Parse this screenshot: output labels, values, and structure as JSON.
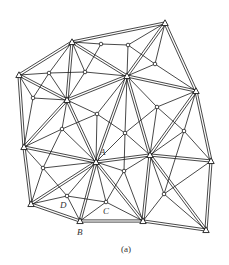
{
  "caption": "(a)",
  "labels": [
    {
      "text": "A",
      "x": 100,
      "y": 155
    },
    {
      "text": "B",
      "x": 77,
      "y": 235
    },
    {
      "text": "C",
      "x": 103,
      "y": 214
    },
    {
      "text": "D",
      "x": 60,
      "y": 208
    }
  ],
  "colors": {
    "line": "#1a1a1a",
    "background": "#ffffff"
  },
  "triangle_nodes": [
    {
      "id": "T1",
      "x": 72,
      "y": 42
    },
    {
      "id": "T2",
      "x": 165,
      "y": 23
    },
    {
      "id": "T3",
      "x": 19,
      "y": 75
    },
    {
      "id": "T4",
      "x": 127,
      "y": 76
    },
    {
      "id": "T5",
      "x": 196,
      "y": 91
    },
    {
      "id": "T6",
      "x": 67,
      "y": 100
    },
    {
      "id": "T7",
      "x": 24,
      "y": 147
    },
    {
      "id": "T8",
      "x": 96,
      "y": 162
    },
    {
      "id": "T9",
      "x": 150,
      "y": 155
    },
    {
      "id": "T10",
      "x": 211,
      "y": 161
    },
    {
      "id": "T11",
      "x": 31,
      "y": 204
    },
    {
      "id": "T12",
      "x": 80,
      "y": 221
    },
    {
      "id": "T13",
      "x": 143,
      "y": 221
    },
    {
      "id": "T14",
      "x": 206,
      "y": 230
    }
  ],
  "circle_nodes": [
    {
      "id": "c1",
      "x": 101,
      "y": 44
    },
    {
      "id": "c2",
      "x": 128,
      "y": 45
    },
    {
      "id": "c3",
      "x": 49,
      "y": 73
    },
    {
      "id": "c4",
      "x": 85,
      "y": 72
    },
    {
      "id": "c5",
      "x": 155,
      "y": 64
    },
    {
      "id": "c6",
      "x": 33,
      "y": 98
    },
    {
      "id": "c7",
      "x": 97,
      "y": 114
    },
    {
      "id": "c8",
      "x": 157,
      "y": 107
    },
    {
      "id": "c9",
      "x": 62,
      "y": 129
    },
    {
      "id": "c10",
      "x": 125,
      "y": 133
    },
    {
      "id": "c11",
      "x": 184,
      "y": 131
    },
    {
      "id": "c12",
      "x": 43,
      "y": 168
    },
    {
      "id": "c13",
      "x": 124,
      "y": 171
    },
    {
      "id": "c14",
      "x": 164,
      "y": 194
    },
    {
      "id": "c15",
      "x": 67,
      "y": 196
    },
    {
      "id": "c16",
      "x": 106,
      "y": 202
    }
  ],
  "double_edges": [
    [
      "T1",
      "T2"
    ],
    [
      "T1",
      "T3"
    ],
    [
      "T2",
      "T5"
    ],
    [
      "T3",
      "T7"
    ],
    [
      "T7",
      "T11"
    ],
    [
      "T11",
      "T12"
    ],
    [
      "T12",
      "T13"
    ],
    [
      "T13",
      "T14"
    ],
    [
      "T14",
      "T10"
    ],
    [
      "T10",
      "T5"
    ],
    [
      "T1",
      "T6"
    ],
    [
      "T1",
      "T4"
    ],
    [
      "T3",
      "T6"
    ],
    [
      "T6",
      "T4"
    ],
    [
      "T4",
      "T2"
    ],
    [
      "T4",
      "T5"
    ],
    [
      "T4",
      "T8"
    ],
    [
      "T6",
      "T8"
    ],
    [
      "T7",
      "T8"
    ],
    [
      "T8",
      "T9"
    ],
    [
      "T9",
      "T10"
    ],
    [
      "T8",
      "T12"
    ],
    [
      "T8",
      "T13"
    ],
    [
      "T9",
      "T13"
    ],
    [
      "T9",
      "T4"
    ],
    [
      "T9",
      "T5"
    ],
    [
      "T9",
      "T14"
    ],
    [
      "T11",
      "T8"
    ],
    [
      "T6",
      "T7"
    ]
  ],
  "single_edges": [
    [
      "T1",
      "c1"
    ],
    [
      "c1",
      "c2"
    ],
    [
      "c2",
      "T2"
    ],
    [
      "c1",
      "c4"
    ],
    [
      "c2",
      "T4"
    ],
    [
      "c2",
      "c5"
    ],
    [
      "T3",
      "c3"
    ],
    [
      "c3",
      "c4"
    ],
    [
      "c4",
      "T4"
    ],
    [
      "c3",
      "T1"
    ],
    [
      "c4",
      "T1"
    ],
    [
      "c3",
      "c6"
    ],
    [
      "c3",
      "T6"
    ],
    [
      "c4",
      "T6"
    ],
    [
      "T2",
      "c5"
    ],
    [
      "c5",
      "T4"
    ],
    [
      "c5",
      "T5"
    ],
    [
      "T3",
      "c6"
    ],
    [
      "c6",
      "T6"
    ],
    [
      "c6",
      "T7"
    ],
    [
      "T6",
      "c7"
    ],
    [
      "c7",
      "T4"
    ],
    [
      "c7",
      "T8"
    ],
    [
      "c7",
      "c10"
    ],
    [
      "c7",
      "c9"
    ],
    [
      "T4",
      "c8"
    ],
    [
      "c8",
      "T5"
    ],
    [
      "c8",
      "T9"
    ],
    [
      "c8",
      "c11"
    ],
    [
      "c8",
      "c10"
    ],
    [
      "T6",
      "c9"
    ],
    [
      "c9",
      "T7"
    ],
    [
      "c9",
      "T8"
    ],
    [
      "c9",
      "c12"
    ],
    [
      "T4",
      "c10"
    ],
    [
      "c10",
      "T8"
    ],
    [
      "c10",
      "T9"
    ],
    [
      "c10",
      "c13"
    ],
    [
      "T5",
      "c11"
    ],
    [
      "c11",
      "T9"
    ],
    [
      "c11",
      "T10"
    ],
    [
      "c11",
      "c14"
    ],
    [
      "T7",
      "c12"
    ],
    [
      "c12",
      "T8"
    ],
    [
      "c12",
      "T11"
    ],
    [
      "c12",
      "c15"
    ],
    [
      "T8",
      "c13"
    ],
    [
      "c13",
      "T9"
    ],
    [
      "c13",
      "c16"
    ],
    [
      "c13",
      "T13"
    ],
    [
      "T9",
      "c14"
    ],
    [
      "c14",
      "T13"
    ],
    [
      "c14",
      "T14"
    ],
    [
      "c14",
      "T10"
    ],
    [
      "T8",
      "c15"
    ],
    [
      "c15",
      "T11"
    ],
    [
      "c15",
      "T12"
    ],
    [
      "c15",
      "c16"
    ],
    [
      "T8",
      "c16"
    ],
    [
      "c16",
      "T12"
    ],
    [
      "c16",
      "T13"
    ]
  ]
}
